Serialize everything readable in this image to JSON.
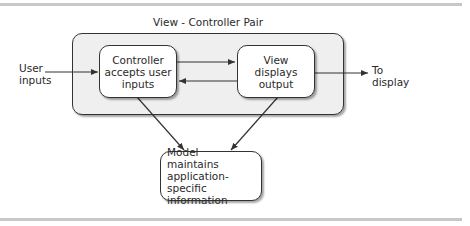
{
  "diagram": {
    "title": "View - Controller Pair",
    "nodes": {
      "controller": {
        "lines": [
          "Controller",
          "accepts user",
          "inputs"
        ]
      },
      "view": {
        "lines": [
          "View",
          "displays",
          "output"
        ]
      },
      "model": {
        "lines": [
          "Model",
          "maintains",
          "application-",
          "specific information"
        ]
      }
    },
    "external": {
      "user_inputs": [
        "User",
        "inputs"
      ],
      "to_display": [
        "To",
        "display"
      ]
    },
    "edges": [
      {
        "from": "User inputs",
        "to": "Controller"
      },
      {
        "from": "Controller",
        "to": "View"
      },
      {
        "from": "View",
        "to": "Controller"
      },
      {
        "from": "View",
        "to": "To display"
      },
      {
        "from": "Controller",
        "to": "Model"
      },
      {
        "from": "View",
        "to": "Model"
      }
    ],
    "colors": {
      "group_fill": "#efefef",
      "node_fill": "#ffffff",
      "stroke": "#333333",
      "rule": "#c8c8c8"
    }
  }
}
